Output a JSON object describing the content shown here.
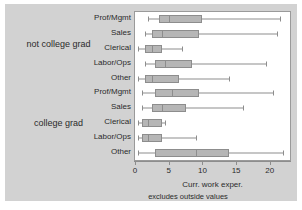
{
  "figure": {
    "background_color": "#ffffff",
    "canvas_color": "#d2d2d2",
    "plot_background_color": "#ffffff",
    "box_fill_color": "#b6b6b6",
    "line_color": "#8d8d8d",
    "text_color": "#2b2b2b"
  },
  "groups": [
    {
      "label": "not college grad"
    },
    {
      "label": "college grad"
    }
  ],
  "axis": {
    "x_title": "Curr. work exper.",
    "note": "excludes outside values",
    "ticks": [
      0,
      5,
      10,
      15,
      20
    ],
    "tick_labels": [
      "0",
      "5",
      "10",
      "15",
      "20"
    ],
    "xlim": [
      0,
      23
    ]
  },
  "chart_data": {
    "type": "box",
    "title": "",
    "subtitle": "",
    "xlabel": "Curr. work exper.",
    "ylabel": "",
    "annotation": "excludes outside values",
    "orientation": "horizontal",
    "xlim": [
      0,
      23
    ],
    "xticks": [
      0,
      5,
      10,
      15,
      20
    ],
    "grid": false,
    "legend": "none",
    "group_variable": "college graduate status",
    "category_variable": "occupation",
    "groups": [
      "not college grad",
      "college grad"
    ],
    "categories": [
      "Prof/Mgmt",
      "Sales",
      "Clerical",
      "Labor/Ops",
      "Other"
    ],
    "boxes": [
      {
        "group": "not college grad",
        "category": "Prof/Mgmt",
        "whisker_low": 2.0,
        "q1": 3.5,
        "median": 5.0,
        "q3": 10.0,
        "whisker_high": 21.5
      },
      {
        "group": "not college grad",
        "category": "Sales",
        "whisker_low": 1.5,
        "q1": 2.5,
        "median": 4.0,
        "q3": 9.5,
        "whisker_high": 21.0
      },
      {
        "group": "not college grad",
        "category": "Clerical",
        "whisker_low": 0.5,
        "q1": 1.5,
        "median": 2.5,
        "q3": 4.0,
        "whisker_high": 7.0
      },
      {
        "group": "not college grad",
        "category": "Labor/Ops",
        "whisker_low": 1.5,
        "q1": 3.0,
        "median": 4.5,
        "q3": 8.5,
        "whisker_high": 19.5
      },
      {
        "group": "not college grad",
        "category": "Other",
        "whisker_low": 0.5,
        "q1": 1.5,
        "median": 2.5,
        "q3": 6.5,
        "whisker_high": 14.0
      },
      {
        "group": "college grad",
        "category": "Prof/Mgmt",
        "whisker_low": 1.0,
        "q1": 3.0,
        "median": 5.5,
        "q3": 9.5,
        "whisker_high": 20.5
      },
      {
        "group": "college grad",
        "category": "Sales",
        "whisker_low": 1.0,
        "q1": 2.5,
        "median": 4.0,
        "q3": 7.5,
        "whisker_high": 16.0
      },
      {
        "group": "college grad",
        "category": "Clerical",
        "whisker_low": 0.5,
        "q1": 1.0,
        "median": 2.0,
        "q3": 4.0,
        "whisker_high": 4.5
      },
      {
        "group": "college grad",
        "category": "Labor/Ops",
        "whisker_low": 0.5,
        "q1": 1.0,
        "median": 2.0,
        "q3": 4.0,
        "whisker_high": 9.0
      },
      {
        "group": "college grad",
        "category": "Other",
        "whisker_low": 0.5,
        "q1": 3.0,
        "median": 9.0,
        "q3": 14.0,
        "whisker_high": 22.0
      }
    ]
  }
}
